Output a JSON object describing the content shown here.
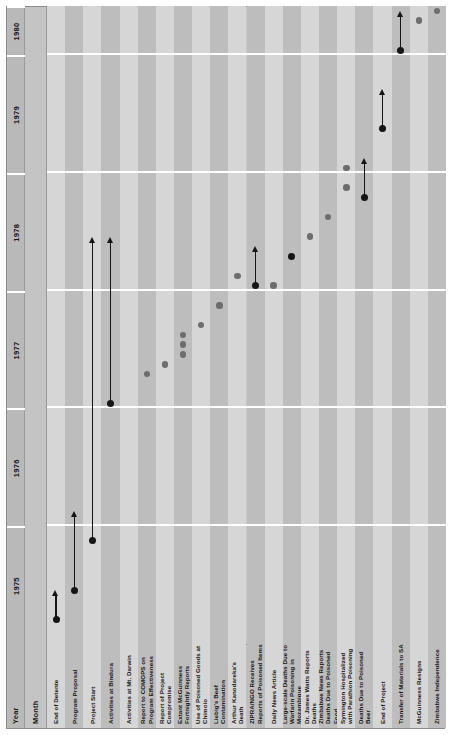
{
  "header": {
    "year_label": "Year",
    "month_label": "Month",
    "years": [
      {
        "year": "1975",
        "months": [
          "J",
          "F",
          "M",
          "A",
          "M",
          "J",
          "J",
          "A",
          "S",
          "O",
          "N",
          "D"
        ]
      },
      {
        "year": "1976",
        "months": [
          "J",
          "F",
          "M",
          "A",
          "M",
          "J",
          "J",
          "A",
          "S",
          "O",
          "N",
          "D"
        ]
      },
      {
        "year": "1977",
        "months": [
          "J",
          "F",
          "M",
          "A",
          "M",
          "J",
          "J",
          "A",
          "S",
          "O",
          "N",
          "D"
        ]
      },
      {
        "year": "1978",
        "months": [
          "J",
          "F",
          "M",
          "A",
          "M",
          "J",
          "J",
          "A",
          "S",
          "O",
          "N",
          "D"
        ]
      },
      {
        "year": "1979",
        "months": [
          "J",
          "F",
          "M",
          "A",
          "M",
          "J",
          "J",
          "A",
          "S",
          "O",
          "N",
          "D"
        ]
      },
      {
        "year": "1980",
        "months": [
          "J",
          "F",
          "M",
          "A",
          "M"
        ]
      }
    ]
  },
  "colors": {
    "panel_background": "#c9c9c9",
    "stripe_light": "#d6d6d6",
    "stripe_dark": "#bdbdbd",
    "header_year": "#b9b9b9",
    "header_month": "#c4c4c4",
    "label_block": "#c2c2c2",
    "marker_solid": "#151515",
    "marker_grey": "#6d6d6d",
    "divider": "#ffffff"
  },
  "rows": [
    {
      "label": "End of Detente"
    },
    {
      "label": "Program Proposal"
    },
    {
      "label": "Project Start"
    },
    {
      "label": "Activities at Bindura"
    },
    {
      "label": "Activities at Mt. Darwin"
    },
    {
      "label": "Report to COMOPS on Program Effectiveness"
    },
    {
      "label": "Report of Project Compromise"
    },
    {
      "label": "Extant McGuinness Fortnightly Reports"
    },
    {
      "label": "Use of Poisoned Goods at Chimoio"
    },
    {
      "label": "Liebig's Beef Contamination"
    },
    {
      "label": "Arthur Kanodareka's Death"
    },
    {
      "label": "ZIPRA/NGO Receives Reports of Poisoned Items"
    },
    {
      "label": "Daily News Article"
    },
    {
      "label": "Large-scale Deaths Due to Warfarin Poisoning in Mozambique"
    },
    {
      "label": "Dr. James Watts Reports Deaths"
    },
    {
      "label": "Zimbabwe News Reports Deaths Due to Poisoned Food"
    },
    {
      "label": "Symington Hospitalized with Parathion Poisoning"
    },
    {
      "label": "Deaths Due to Poisoned Beer"
    },
    {
      "label": "End of Project"
    },
    {
      "label": "Transfer of Materials to SA"
    },
    {
      "label": "McGuinness Resigns"
    },
    {
      "label": "Zimbabwe Independence"
    }
  ],
  "chart_data": {
    "type": "timeline",
    "title": "",
    "xlabel": "Month",
    "ylabel": "",
    "x_axis": {
      "start": "1975-01",
      "end": "1980-05",
      "unit": "month",
      "total_months": 65,
      "year_ticks": [
        "1975",
        "1976",
        "1977",
        "1978",
        "1979",
        "1980"
      ],
      "month_ticks": [
        "J",
        "F",
        "M",
        "A",
        "M",
        "J",
        "J",
        "A",
        "S",
        "O",
        "N",
        "D"
      ]
    },
    "grid": false,
    "legend": null,
    "marker_types": {
      "solid_dot": "event start point (black)",
      "grey_dot": "discrete point event (grey)",
      "arrow": "ongoing / continuing period"
    },
    "events": [
      {
        "row": 0,
        "label": "End of Detente",
        "marker": "solid_dot_with_arrow",
        "start_month": 2,
        "arrow_end_month": 5,
        "date": "1975-03"
      },
      {
        "row": 1,
        "label": "Program Proposal",
        "marker": "solid_dot_with_arrow",
        "start_month": 5,
        "arrow_end_month": 13,
        "date": "1975-06"
      },
      {
        "row": 2,
        "label": "Project Start",
        "marker": "solid_dot_with_arrow",
        "start_month": 10,
        "arrow_end_month": 41,
        "date": "1975-11"
      },
      {
        "row": 3,
        "label": "Activities at Bindura",
        "marker": "solid_dot_with_arrow",
        "start_month": 24,
        "arrow_end_month": 41,
        "date": "1977-01"
      },
      {
        "row": 4,
        "label": "Activities at Mt. Darwin",
        "marker": "none"
      },
      {
        "row": 5,
        "label": "Report to COMOPS on Program Effectiveness",
        "marker": "grey_dot",
        "month": 27,
        "date": "1977-04"
      },
      {
        "row": 6,
        "label": "Report of Project Compromise",
        "marker": "grey_dot",
        "month": 28,
        "date": "1977-05"
      },
      {
        "row": 7,
        "label": "Extant McGuinness Fortnightly Reports",
        "marker": "grey_dot_multi",
        "months": [
          29,
          30,
          31
        ],
        "date": "1977-06 to 1977-08"
      },
      {
        "row": 8,
        "label": "Use of Poisoned Goods at Chimoio",
        "marker": "grey_dot",
        "month": 32,
        "date": "1977-09"
      },
      {
        "row": 9,
        "label": "Liebig's Beef Contamination",
        "marker": "grey_dot",
        "month": 34,
        "date": "1977-11"
      },
      {
        "row": 10,
        "label": "Arthur Kanodareka's Death",
        "marker": "grey_dot",
        "month": 37,
        "date": "1978-02"
      },
      {
        "row": 11,
        "label": "ZIPRA/NGO Receives Reports of Poisoned Items",
        "marker": "solid_dot_with_arrow",
        "start_month": 36,
        "arrow_end_month": 40,
        "date": "1978-01"
      },
      {
        "row": 12,
        "label": "Daily News Article",
        "marker": "grey_dot",
        "month": 36,
        "date": "1978-01"
      },
      {
        "row": 13,
        "label": "Large-scale Deaths Due to Warfarin Poisoning in Mozambique",
        "marker": "solid_dot",
        "month": 39,
        "date": "1978-04"
      },
      {
        "row": 14,
        "label": "Dr. James Watts Reports Deaths",
        "marker": "grey_dot",
        "month": 41,
        "date": "1978-06"
      },
      {
        "row": 15,
        "label": "Zimbabwe News Reports Deaths Due to Poisoned Food",
        "marker": "grey_dot",
        "month": 43,
        "date": "1978-08"
      },
      {
        "row": 16,
        "label": "Symington Hospitalized with Parathion Poisoning",
        "marker": "grey_dot_multi",
        "months": [
          46,
          48
        ],
        "date": "1978-11 / 1979-01"
      },
      {
        "row": 17,
        "label": "Deaths Due to Poisoned Beer",
        "marker": "solid_dot_with_arrow",
        "start_month": 45,
        "arrow_end_month": 49,
        "date": "1978-10"
      },
      {
        "row": 18,
        "label": "End of Project",
        "marker": "solid_dot_with_arrow",
        "start_month": 52,
        "arrow_end_month": 56,
        "date": "1979-05"
      },
      {
        "row": 19,
        "label": "Transfer of Materials to SA",
        "marker": "solid_dot_with_arrow",
        "start_month": 60,
        "arrow_end_month": 64,
        "date": "1980-01"
      },
      {
        "row": 20,
        "label": "McGuinness Resigns",
        "marker": "grey_dot",
        "month": 63,
        "date": "1980-04"
      },
      {
        "row": 21,
        "label": "Zimbabwe Independence",
        "marker": "grey_dot",
        "month": 64,
        "date": "1980-05"
      }
    ]
  }
}
